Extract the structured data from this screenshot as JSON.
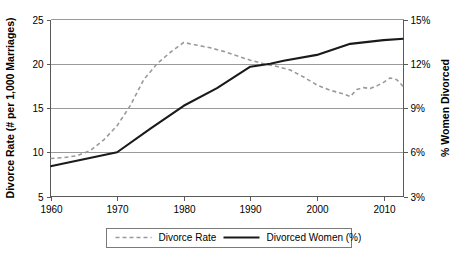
{
  "chart_data": {
    "type": "line",
    "title": "",
    "xlabel": "",
    "ylabel": "Divorce Rate (# per 1,000 Marriages)",
    "y2label": "% Women Divorced",
    "xlim": [
      1960,
      2013
    ],
    "ylim": [
      5,
      25
    ],
    "y2lim": [
      3,
      15
    ],
    "xticks": [
      1960,
      1970,
      1980,
      1990,
      2000,
      2010
    ],
    "xtick_labels": [
      "1960",
      "1970",
      "1980",
      "1990",
      "2000",
      "2010"
    ],
    "yticks": [
      5,
      10,
      15,
      20,
      25
    ],
    "ytick_labels": [
      "5",
      "10",
      "15",
      "20",
      "25"
    ],
    "y2ticks": [
      3,
      6,
      9,
      12,
      15
    ],
    "y2tick_labels": [
      "3%",
      "6%",
      "9%",
      "12%",
      "15%"
    ],
    "grid": true,
    "grid_axis": "y",
    "legend_position": "bottom",
    "series": [
      {
        "name": "Divorce Rate",
        "axis": "left",
        "style": "dashed",
        "color": "#9a9a9a",
        "x": [
          1960,
          1962,
          1964,
          1966,
          1968,
          1970,
          1972,
          1974,
          1976,
          1978,
          1980,
          1982,
          1984,
          1986,
          1988,
          1990,
          1992,
          1994,
          1996,
          1998,
          2000,
          2002,
          2004,
          2005,
          2006,
          2007,
          2008,
          2009,
          2010,
          2011,
          2012,
          2013
        ],
        "values": [
          9.3,
          9.4,
          9.6,
          10.2,
          11.4,
          13.0,
          15.3,
          18.2,
          20.0,
          21.3,
          22.4,
          22.1,
          21.8,
          21.4,
          20.9,
          20.4,
          20.0,
          19.7,
          19.3,
          18.5,
          17.6,
          17.0,
          16.6,
          16.3,
          17.1,
          17.3,
          17.2,
          17.5,
          17.9,
          18.4,
          18.2,
          17.4
        ]
      },
      {
        "name": "Divorced Women (%)",
        "axis": "right",
        "style": "solid",
        "color": "#1a1a1a",
        "x": [
          1960,
          1970,
          1975,
          1980,
          1985,
          1990,
          1993,
          1995,
          2000,
          2005,
          2008,
          2010,
          2013
        ],
        "values": [
          5.05,
          6.0,
          7.6,
          9.15,
          10.35,
          11.8,
          12.0,
          12.2,
          12.6,
          13.35,
          13.5,
          13.6,
          13.7
        ]
      }
    ],
    "legend": [
      {
        "label": "Divorce Rate",
        "style": "dashed",
        "color": "#9a9a9a"
      },
      {
        "label": "Divorced Women (%)",
        "style": "solid",
        "color": "#1a1a1a"
      }
    ]
  },
  "colors": {
    "background": "#ffffff",
    "grid": "#808080",
    "frame": "#595959",
    "series_dashed": "#9a9a9a",
    "series_solid": "#1a1a1a",
    "text": "#000000"
  }
}
